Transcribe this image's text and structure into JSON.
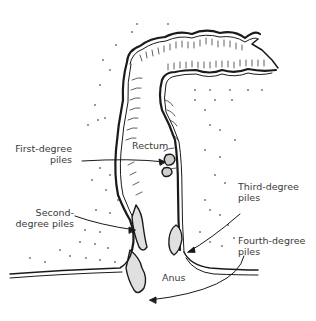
{
  "diagram": {
    "type": "anatomical-illustration",
    "labels": {
      "first_degree": "First-degree\npiles",
      "second_degree": "Second-\ndegree piles",
      "third_degree": "Third-degree\npiles",
      "fourth_degree": "Fourth-degree\npiles",
      "rectum": "Rectum",
      "anus": "Anus"
    },
    "colors": {
      "ink": "#1a1a1a",
      "text": "#3a3a3a",
      "background": "#ffffff"
    }
  }
}
